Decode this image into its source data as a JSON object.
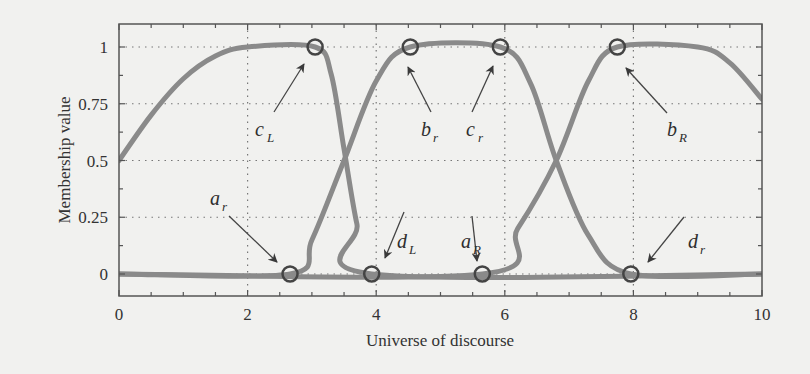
{
  "chart_data": {
    "type": "line",
    "title": "",
    "xlabel": "Universe of discourse",
    "ylabel": "Membership value",
    "xlim": [
      0,
      10
    ],
    "ylim": [
      -0.09,
      1.1
    ],
    "grid": true,
    "grid_style": "dotted",
    "x_ticks": [
      0,
      2,
      4,
      6,
      8,
      10
    ],
    "x_tick_labels": [
      "0",
      "2",
      "4",
      "6",
      "8",
      "10"
    ],
    "y_ticks": [
      0,
      0.25,
      0.5,
      0.75,
      1
    ],
    "y_tick_labels": [
      "0",
      "0.25",
      "0.5",
      "0.75",
      "1"
    ],
    "line_color": "#8a8a8a",
    "series": [
      {
        "name": "left-shoulder",
        "description": "Membership rises from 0.5 at x=0 to 1 at x≈2, stays 1 until c_L≈3.05, falls to 0 at d_L≈3.93, then 0",
        "points": [
          [
            0,
            0.5
          ],
          [
            0.5,
            0.7
          ],
          [
            1,
            0.86
          ],
          [
            1.5,
            0.96
          ],
          [
            2,
            1
          ],
          [
            3.05,
            1
          ],
          [
            3.3,
            0.88
          ],
          [
            3.5,
            0.55
          ],
          [
            3.7,
            0.22
          ],
          [
            3.93,
            0
          ],
          [
            10,
            0
          ]
        ]
      },
      {
        "name": "middle",
        "description": "Zero until a_r≈2.66, rises to 1 at b_r≈4.53, flat until c_r≈5.93, falls to 0 at d_r≈7.96",
        "points": [
          [
            0,
            0
          ],
          [
            2.66,
            0
          ],
          [
            3.0,
            0.15
          ],
          [
            3.5,
            0.5
          ],
          [
            4.0,
            0.85
          ],
          [
            4.53,
            1
          ],
          [
            5.93,
            1
          ],
          [
            6.4,
            0.84
          ],
          [
            6.8,
            0.5
          ],
          [
            7.3,
            0.17
          ],
          [
            7.96,
            0
          ],
          [
            10,
            0
          ]
        ]
      },
      {
        "name": "right-shoulder",
        "description": "Zero until a_R≈5.65, rises to 1 at b_R≈7.75, flat until ≈9, falls to ≈0.77 at x=10",
        "points": [
          [
            0,
            0
          ],
          [
            5.65,
            0
          ],
          [
            6.2,
            0.2
          ],
          [
            6.8,
            0.5
          ],
          [
            7.3,
            0.85
          ],
          [
            7.75,
            1
          ],
          [
            9.0,
            1
          ],
          [
            9.5,
            0.93
          ],
          [
            10,
            0.77
          ]
        ]
      }
    ],
    "markers": [
      {
        "label": "a",
        "sub": "r",
        "x": 2.66,
        "y": 0
      },
      {
        "label": "c",
        "sub": "L",
        "x": 3.05,
        "y": 1
      },
      {
        "label": "d",
        "sub": "L",
        "x": 3.93,
        "y": 0
      },
      {
        "label": "b",
        "sub": "r",
        "x": 4.53,
        "y": 1
      },
      {
        "label": "a",
        "sub": "R",
        "x": 5.65,
        "y": 0
      },
      {
        "label": "c",
        "sub": "r",
        "x": 5.93,
        "y": 1
      },
      {
        "label": "b",
        "sub": "R",
        "x": 7.75,
        "y": 1
      },
      {
        "label": "d",
        "sub": "r",
        "x": 7.96,
        "y": 0
      }
    ],
    "annotations": [
      {
        "id": "cL",
        "text": "c",
        "sub": "L",
        "tx": 255,
        "ty": 136,
        "ax1": 274,
        "ay1": 112,
        "ax2": 304,
        "ay2": 64
      },
      {
        "id": "br",
        "text": "b",
        "sub": "r",
        "tx": 421,
        "ty": 136,
        "ax1": 431,
        "ay1": 112,
        "ax2": 408,
        "ay2": 67
      },
      {
        "id": "cr",
        "text": "c",
        "sub": "r",
        "tx": 466,
        "ty": 136,
        "ax1": 472,
        "ay1": 112,
        "ax2": 493,
        "ay2": 66
      },
      {
        "id": "bR",
        "text": "b",
        "sub": "R",
        "tx": 667,
        "ty": 136,
        "ax1": 667,
        "ay1": 113,
        "ax2": 626,
        "ay2": 68
      },
      {
        "id": "ar",
        "text": "a",
        "sub": "r",
        "tx": 210,
        "ty": 205,
        "ax1": 229,
        "ay1": 216,
        "ax2": 277,
        "ay2": 262
      },
      {
        "id": "dL",
        "text": "d",
        "sub": "L",
        "tx": 397,
        "ty": 248,
        "ax1": 404,
        "ay1": 212,
        "ax2": 385,
        "ay2": 258
      },
      {
        "id": "aR",
        "text": "a",
        "sub": "R",
        "tx": 461,
        "ty": 248,
        "ax1": 472,
        "ay1": 216,
        "ax2": 477,
        "ay2": 261
      },
      {
        "id": "dr",
        "text": "d",
        "sub": "r",
        "tx": 688,
        "ty": 248,
        "ax1": 684,
        "ay1": 217,
        "ax2": 648,
        "ay2": 262
      }
    ]
  }
}
